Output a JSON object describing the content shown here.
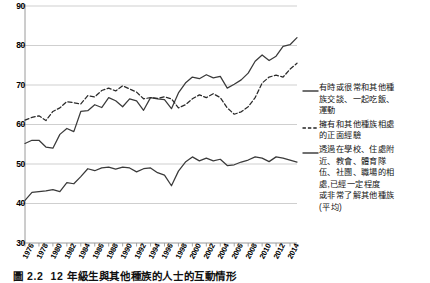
{
  "figure": {
    "caption_number": "圖 2.2",
    "caption_text": "12 年級生與其他種族的人士的互動情形"
  },
  "chart_data": {
    "type": "line",
    "title": "",
    "subtitle": "",
    "xlabel": "",
    "ylabel": "",
    "grid": "horizontal",
    "legend_position": "right",
    "ylim": [
      30,
      90
    ],
    "yticks": [
      30,
      40,
      50,
      60,
      70,
      80,
      90
    ],
    "ytick_labels": [
      "30",
      "40",
      "50",
      "60",
      "70",
      "80",
      "90"
    ],
    "xlim": [
      1976,
      2015
    ],
    "xticks": [
      1976,
      1978,
      1980,
      1982,
      1984,
      1986,
      1988,
      1990,
      1992,
      1994,
      1996,
      1998,
      2000,
      2002,
      2004,
      2006,
      2008,
      2010,
      2012,
      2014
    ],
    "xtick_labels": [
      "1976",
      "1978",
      "1980",
      "1982",
      "1984",
      "1986",
      "1988",
      "1990",
      "1992",
      "1994",
      "1996",
      "1998",
      "2000",
      "2002",
      "2004",
      "2006",
      "2008",
      "2010",
      "2012",
      "2014"
    ],
    "x": [
      1976,
      1977,
      1978,
      1979,
      1980,
      1981,
      1982,
      1983,
      1984,
      1985,
      1986,
      1987,
      1988,
      1989,
      1990,
      1991,
      1992,
      1993,
      1994,
      1995,
      1996,
      1997,
      1998,
      1999,
      2000,
      2001,
      2002,
      2003,
      2004,
      2005,
      2006,
      2007,
      2008,
      2009,
      2010,
      2011,
      2012,
      2013,
      2014,
      2015
    ],
    "series": [
      {
        "name": "有時或很常和其他種族交談、一起吃飯、運動",
        "style": "solid",
        "color": "#3a3a3a",
        "values": [
          55.2,
          56.0,
          56.0,
          54.3,
          54.0,
          57.5,
          59.0,
          58.2,
          63.3,
          63.5,
          65.0,
          64.3,
          66.8,
          66.0,
          64.5,
          66.5,
          66.0,
          63.6,
          66.8,
          66.5,
          66.3,
          64.0,
          68.0,
          70.5,
          72.0,
          71.6,
          72.6,
          71.8,
          72.2,
          69.2,
          70.2,
          71.3,
          73.0,
          76.0,
          77.6,
          76.2,
          77.3,
          79.8,
          80.2,
          82.0
        ]
      },
      {
        "name": "擁有和其他種族相處的正面經驗",
        "style": "dashed",
        "color": "#2a2a2a",
        "values": [
          61.1,
          61.8,
          62.2,
          61.0,
          63.3,
          64.2,
          65.8,
          65.5,
          65.2,
          67.3,
          67.0,
          68.6,
          69.2,
          68.5,
          69.8,
          69.0,
          68.2,
          66.5,
          66.8,
          66.6,
          67.0,
          66.5,
          64.2,
          65.0,
          66.5,
          67.5,
          66.8,
          67.8,
          66.8,
          64.2,
          62.6,
          63.2,
          64.5,
          66.8,
          70.5,
          72.0,
          72.5,
          72.0,
          74.0,
          75.5
        ]
      },
      {
        "name": "透過在學校、住處附近、教會、體育隊伍、社團、職場的相處,已經一定程度或非常了解其他種族(平均)",
        "style": "solid",
        "color": "#3a3a3a",
        "values": [
          40.8,
          42.8,
          43.0,
          43.2,
          43.5,
          43.0,
          45.3,
          45.0,
          46.8,
          48.8,
          48.3,
          49.0,
          49.2,
          48.7,
          49.2,
          49.0,
          48.0,
          48.8,
          49.0,
          47.8,
          47.2,
          44.5,
          48.2,
          50.5,
          51.8,
          50.8,
          51.5,
          50.8,
          51.2,
          49.6,
          49.8,
          50.5,
          51.0,
          51.8,
          51.5,
          50.6,
          51.8,
          51.5,
          51.0,
          50.5
        ]
      }
    ],
    "legend_entries": [
      {
        "marker": "solid-line",
        "lines": [
          "有時或很常和其他種",
          "族交談、一起吃飯、",
          "運動"
        ]
      },
      {
        "marker": "dashed-line",
        "lines": [
          "擁有和其他種族相處",
          "的正面經驗"
        ]
      },
      {
        "marker": "solid-line",
        "lines": [
          "透過在學校、住處附",
          "近、教會、體育隊",
          "伍、社團、職場的相",
          "處,已經一定程度",
          "或非常了解其他種族",
          "(平均)"
        ]
      }
    ]
  }
}
